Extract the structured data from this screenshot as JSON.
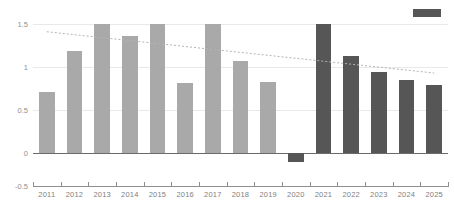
{
  "chart_data": {
    "type": "bar",
    "title": "",
    "subtitle": "",
    "xlabel": "",
    "ylabel": "",
    "categories": [
      "2011",
      "2012",
      "2013",
      "2014",
      "2015",
      "2016",
      "2017",
      "2018",
      "2019",
      "2020",
      "2021",
      "2022",
      "2023",
      "2024",
      "2025"
    ],
    "series": [
      {
        "name": "Actual",
        "values": [
          0.71,
          1.19,
          1.5,
          1.36,
          1.5,
          0.81,
          1.5,
          1.07,
          0.83,
          -0.1,
          null,
          null,
          null,
          null,
          null
        ],
        "color": "#a9a9a9"
      },
      {
        "name": "Forecast",
        "values": [
          null,
          null,
          null,
          null,
          null,
          null,
          null,
          null,
          null,
          null,
          1.5,
          1.13,
          0.94,
          0.85,
          0.79
        ],
        "color": "#565656"
      }
    ],
    "bars": [
      {
        "category": "2011",
        "value": 0.71,
        "series": "Actual",
        "color": "#a9a9a9"
      },
      {
        "category": "2012",
        "value": 1.19,
        "series": "Actual",
        "color": "#a9a9a9"
      },
      {
        "category": "2013",
        "value": 1.5,
        "series": "Actual",
        "color": "#a9a9a9"
      },
      {
        "category": "2014",
        "value": 1.36,
        "series": "Actual",
        "color": "#a9a9a9"
      },
      {
        "category": "2015",
        "value": 1.5,
        "series": "Actual",
        "color": "#a9a9a9"
      },
      {
        "category": "2016",
        "value": 0.81,
        "series": "Actual",
        "color": "#a9a9a9"
      },
      {
        "category": "2017",
        "value": 1.5,
        "series": "Actual",
        "color": "#a9a9a9"
      },
      {
        "category": "2018",
        "value": 1.07,
        "series": "Actual",
        "color": "#a9a9a9"
      },
      {
        "category": "2019",
        "value": 0.83,
        "series": "Actual",
        "color": "#a9a9a9"
      },
      {
        "category": "2020",
        "value": -0.1,
        "series": "Forecast",
        "color": "#565656"
      },
      {
        "category": "2021",
        "value": 1.5,
        "series": "Forecast",
        "color": "#565656"
      },
      {
        "category": "2022",
        "value": 1.13,
        "series": "Forecast",
        "color": "#565656"
      },
      {
        "category": "2023",
        "value": 0.94,
        "series": "Forecast",
        "color": "#565656"
      },
      {
        "category": "2024",
        "value": 0.85,
        "series": "Forecast",
        "color": "#565656"
      },
      {
        "category": "2025",
        "value": 0.79,
        "series": "Forecast",
        "color": "#565656"
      }
    ],
    "yticks": [
      1.5,
      1,
      0.5,
      0,
      -0.5
    ],
    "ytick_labels": [
      "1.5",
      "1",
      "0.5",
      "0",
      "-0.5"
    ],
    "ylim": [
      -0.5,
      1.5
    ],
    "grid": true,
    "gridline_color": "#e9e9e9",
    "zero_line_color": "#6b6b6b",
    "legend": {
      "position": "top-right",
      "entries": [
        {
          "label": "",
          "color": "#565656",
          "name": "forecast-swatch"
        }
      ]
    },
    "trendlines": [
      {
        "name": "declining-trendline",
        "style": "dotted",
        "color": "#b4b4b4",
        "x_start_category": "2011",
        "x_end_category": "2025",
        "y_start": 1.41,
        "y_end": 0.93
      }
    ]
  }
}
